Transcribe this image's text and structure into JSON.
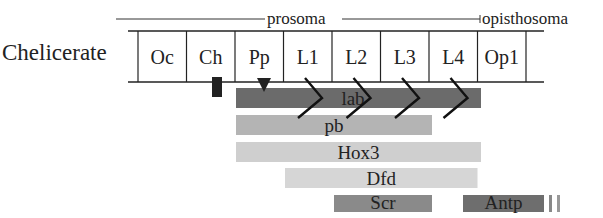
{
  "organism_label": "Chelicerate",
  "regions": {
    "prosoma": "prosoma",
    "opisthosoma": "opisthosoma"
  },
  "segments": [
    "Oc",
    "Ch",
    "Pp",
    "L1",
    "L2",
    "L3",
    "L4",
    "Op1"
  ],
  "genes": [
    {
      "name": "lab",
      "start_segment": "Pp",
      "end_segment": "L4",
      "color": "#6b6b6b"
    },
    {
      "name": "pb",
      "start_segment": "Pp",
      "end_segment": "L3",
      "color": "#b4b4b4"
    },
    {
      "name": "Hox3",
      "start_segment": "Pp",
      "end_segment": "L4",
      "color": "#cfcfcf"
    },
    {
      "name": "Dfd",
      "start_segment": "L1",
      "end_segment": "L4",
      "color": "#d6d6d6"
    },
    {
      "name": "Scr",
      "start_segment": "L2",
      "end_segment": "L3",
      "color": "#8a8a8a"
    },
    {
      "name": "Antp",
      "start_segment": "L4",
      "end_segment": "Op1",
      "color": "#6e6e6e"
    }
  ],
  "markers": {
    "ch_bar": "Ch",
    "pp_triangle": "Pp",
    "leg_chevrons": [
      "L1",
      "L2",
      "L3",
      "L4"
    ]
  }
}
